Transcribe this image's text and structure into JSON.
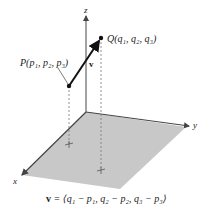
{
  "figure": {
    "axes": {
      "x_label": "x",
      "y_label": "y",
      "z_label": "z"
    },
    "points": {
      "P": {
        "name": "P",
        "label": "P(p₁, p₂, p₃)"
      },
      "Q": {
        "name": "Q",
        "label": "Q(q₁, q₂, q₃)"
      }
    },
    "vector_label": "v",
    "caption": "v = ⟨q₁ − p₁, q₂ − p₂, q₃ − p₃⟩",
    "caption_parts": {
      "lhs": "v",
      "rhs": " = ⟨q₁ − p₁, q₂ − p₂, q₃ − p₃⟩"
    },
    "colors": {
      "plane": "#c8c8c8",
      "axis": "#444444",
      "vector": "#111111",
      "dashed": "#777777"
    }
  }
}
